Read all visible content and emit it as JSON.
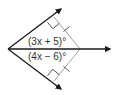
{
  "diagram": {
    "type": "angle-bisector-figure",
    "labels": {
      "upper_angle": "(3x + 5)°",
      "lower_angle": "(4x − 6)°"
    },
    "colors": {
      "ray": "#1a1a1a",
      "perpendicular": "#a0a0a0",
      "label": "#333333",
      "background": "#ffffff"
    },
    "marks": {
      "right_angles": 2,
      "congruence_ticks": 2
    }
  }
}
